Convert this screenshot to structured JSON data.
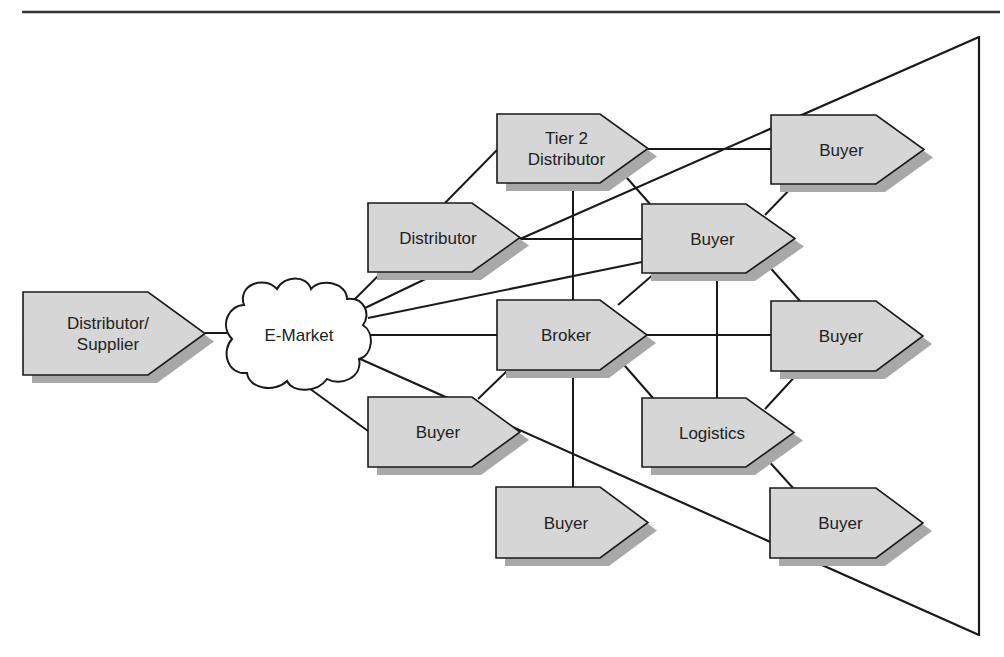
{
  "diagram": {
    "colors": {
      "background": "#ffffff",
      "stroke": "#1a1a1a",
      "node_fill": "#d6d6d6",
      "node_shadow": "#a8a8a8",
      "cloud_fill": "#ffffff"
    },
    "top_rule": {
      "x1": 22,
      "y1": 12,
      "x2": 1000,
      "y2": 12
    },
    "funnel": {
      "points": [
        [
          979,
          37
        ],
        [
          979,
          635
        ],
        [
          768,
          528
        ]
      ],
      "upper_line": {
        "x1": 520,
        "y1": 239,
        "x2": 979,
        "y2": 37
      },
      "lower_line": {
        "x1": 358,
        "y1": 358,
        "x2": 979,
        "y2": 635
      }
    },
    "cloud": {
      "id": "emarket",
      "label": "E-Market",
      "cx": 299,
      "cy": 335
    },
    "nodes": [
      {
        "id": "supplier",
        "lines": [
          "Distributor/",
          "Supplier"
        ],
        "x": 23,
        "y": 292,
        "w": 125,
        "h": 83,
        "tip": 57
      },
      {
        "id": "tier2",
        "lines": [
          "Tier 2",
          "Distributor"
        ],
        "x": 497,
        "y": 114,
        "w": 103,
        "h": 69,
        "tip": 48
      },
      {
        "id": "distributor",
        "lines": [
          "Distributor"
        ],
        "x": 368,
        "y": 203,
        "w": 104,
        "h": 69,
        "tip": 48
      },
      {
        "id": "buyer_top_right",
        "lines": [
          "Buyer"
        ],
        "x": 771,
        "y": 115,
        "w": 105,
        "h": 69,
        "tip": 48
      },
      {
        "id": "buyer_mid",
        "lines": [
          "Buyer"
        ],
        "x": 642,
        "y": 204,
        "w": 104,
        "h": 69,
        "tip": 49
      },
      {
        "id": "broker",
        "lines": [
          "Broker"
        ],
        "x": 497,
        "y": 300,
        "w": 103,
        "h": 70,
        "tip": 47
      },
      {
        "id": "buyer_mid_right",
        "lines": [
          "Buyer"
        ],
        "x": 771,
        "y": 301,
        "w": 105,
        "h": 70,
        "tip": 47
      },
      {
        "id": "buyer_left",
        "lines": [
          "Buyer"
        ],
        "x": 368,
        "y": 397,
        "w": 104,
        "h": 70,
        "tip": 48
      },
      {
        "id": "logistics",
        "lines": [
          "Logistics"
        ],
        "x": 642,
        "y": 398,
        "w": 104,
        "h": 69,
        "tip": 48
      },
      {
        "id": "buyer_bottom",
        "lines": [
          "Buyer"
        ],
        "x": 496,
        "y": 487,
        "w": 104,
        "h": 71,
        "tip": 48
      },
      {
        "id": "buyer_bottom_right",
        "lines": [
          "Buyer"
        ],
        "x": 770,
        "y": 488,
        "w": 106,
        "h": 70,
        "tip": 47
      }
    ],
    "edges": [
      {
        "from": "supplier",
        "to": "emarket",
        "x1": 205,
        "y1": 333,
        "x2": 232,
        "y2": 333
      },
      {
        "from": "emarket",
        "to": "distributor",
        "x1": 352,
        "y1": 302,
        "x2": 382,
        "y2": 272
      },
      {
        "from": "emarket",
        "to": "distributor_shadow",
        "x1": 365,
        "y1": 308,
        "x2": 440,
        "y2": 272
      },
      {
        "from": "emarket",
        "to": "buyer_mid",
        "x1": 368,
        "y1": 318,
        "x2": 642,
        "y2": 262
      },
      {
        "from": "emarket",
        "to": "broker",
        "x1": 370,
        "y1": 335,
        "x2": 497,
        "y2": 335
      },
      {
        "from": "emarket",
        "to": "buyer_left",
        "x1": 302,
        "y1": 383,
        "x2": 368,
        "y2": 431
      },
      {
        "from": "distributor",
        "to": "tier2",
        "x1": 445,
        "y1": 203,
        "x2": 497,
        "y2": 150
      },
      {
        "from": "distributor",
        "to": "buyer_mid",
        "x1": 520,
        "y1": 239,
        "x2": 642,
        "y2": 239
      },
      {
        "from": "tier2",
        "to": "buyer_top_right",
        "x1": 648,
        "y1": 149,
        "x2": 771,
        "y2": 149
      },
      {
        "from": "tier2",
        "to": "buyer_mid",
        "x1": 620,
        "y1": 170,
        "x2": 650,
        "y2": 204
      },
      {
        "from": "tier2",
        "to": "broker",
        "x1": 573,
        "y1": 183,
        "x2": 573,
        "y2": 300
      },
      {
        "from": "buyer_mid",
        "to": "buyer_top_right",
        "x1": 765,
        "y1": 215,
        "x2": 795,
        "y2": 184
      },
      {
        "from": "buyer_mid",
        "to": "broker",
        "x1": 655,
        "y1": 273,
        "x2": 618,
        "y2": 305
      },
      {
        "from": "buyer_mid",
        "to": "logistics",
        "x1": 717,
        "y1": 273,
        "x2": 717,
        "y2": 398
      },
      {
        "from": "buyer_mid",
        "to": "buyer_mid_right",
        "x1": 765,
        "y1": 262,
        "x2": 800,
        "y2": 301
      },
      {
        "from": "broker",
        "to": "buyer_mid_right",
        "x1": 647,
        "y1": 335,
        "x2": 771,
        "y2": 335
      },
      {
        "from": "broker",
        "to": "logistics",
        "x1": 618,
        "y1": 358,
        "x2": 653,
        "y2": 398
      },
      {
        "from": "broker",
        "to": "buyer_left",
        "x1": 508,
        "y1": 370,
        "x2": 478,
        "y2": 399
      },
      {
        "from": "broker",
        "to": "buyer_bottom",
        "x1": 573,
        "y1": 370,
        "x2": 573,
        "y2": 487
      },
      {
        "from": "logistics",
        "to": "buyer_mid_right",
        "x1": 765,
        "y1": 409,
        "x2": 800,
        "y2": 371
      },
      {
        "from": "logistics",
        "to": "buyer_bottom_right",
        "x1": 765,
        "y1": 457,
        "x2": 793,
        "y2": 488
      }
    ]
  }
}
